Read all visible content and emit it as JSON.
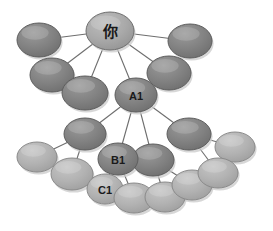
{
  "diagram": {
    "background_color": "#ffffff",
    "colors": {
      "node_dark_fill": "#7f7f7f",
      "node_dark_stroke": "#5e5e5e",
      "node_light_fill": "#b0b0b0",
      "node_light_stroke": "#8a8a8a",
      "node_root_fill": "#a8a8a8",
      "node_root_stroke": "#6f6f6f",
      "edge_color": "#6e6e6e",
      "label_color": "#1a1a1a",
      "shadow_color": "#c9c9c9"
    },
    "nodes": [
      {
        "id": "root",
        "label": "你",
        "cx": 110,
        "cy": 31,
        "rx": 24,
        "ry": 19,
        "tone": "root",
        "font_size": 15
      },
      {
        "id": "n-tl1",
        "label": "",
        "cx": 39,
        "cy": 40,
        "rx": 22,
        "ry": 17,
        "tone": "dark",
        "font_size": 9
      },
      {
        "id": "n-tl2",
        "label": "",
        "cx": 52,
        "cy": 75,
        "rx": 22,
        "ry": 17,
        "tone": "dark",
        "font_size": 9
      },
      {
        "id": "n-tl3",
        "label": "",
        "cx": 85,
        "cy": 93,
        "rx": 23,
        "ry": 17,
        "tone": "dark",
        "font_size": 9
      },
      {
        "id": "n-tr1",
        "label": "",
        "cx": 190,
        "cy": 41,
        "rx": 22,
        "ry": 17,
        "tone": "dark",
        "font_size": 9
      },
      {
        "id": "n-tr2",
        "label": "",
        "cx": 169,
        "cy": 73,
        "rx": 22,
        "ry": 17,
        "tone": "dark",
        "font_size": 9
      },
      {
        "id": "a1",
        "label": "A1",
        "cx": 136,
        "cy": 95,
        "rx": 21,
        "ry": 17,
        "tone": "dark",
        "font_size": 11
      },
      {
        "id": "n-m1",
        "label": "",
        "cx": 85,
        "cy": 134,
        "rx": 21,
        "ry": 16,
        "tone": "dark",
        "font_size": 9
      },
      {
        "id": "n-m2",
        "label": "",
        "cx": 153,
        "cy": 160,
        "rx": 21,
        "ry": 16,
        "tone": "dark",
        "font_size": 9
      },
      {
        "id": "n-m3",
        "label": "",
        "cx": 189,
        "cy": 134,
        "rx": 22,
        "ry": 16,
        "tone": "dark",
        "font_size": 9
      },
      {
        "id": "b1",
        "label": "B1",
        "cx": 118,
        "cy": 159,
        "rx": 20,
        "ry": 16,
        "tone": "dark",
        "font_size": 11
      },
      {
        "id": "n-l1",
        "label": "",
        "cx": 37,
        "cy": 157,
        "rx": 20,
        "ry": 15,
        "tone": "light",
        "font_size": 9
      },
      {
        "id": "n-l2",
        "label": "",
        "cx": 72,
        "cy": 174,
        "rx": 21,
        "ry": 16,
        "tone": "light",
        "font_size": 9
      },
      {
        "id": "c1",
        "label": "C1",
        "cx": 105,
        "cy": 189,
        "rx": 18,
        "ry": 15,
        "tone": "light",
        "font_size": 11
      },
      {
        "id": "n-b1",
        "label": "",
        "cx": 134,
        "cy": 198,
        "rx": 20,
        "ry": 15,
        "tone": "light",
        "font_size": 9
      },
      {
        "id": "n-b2",
        "label": "",
        "cx": 165,
        "cy": 197,
        "rx": 20,
        "ry": 15,
        "tone": "light",
        "font_size": 9
      },
      {
        "id": "n-b3",
        "label": "",
        "cx": 192,
        "cy": 185,
        "rx": 20,
        "ry": 15,
        "tone": "light",
        "font_size": 9
      },
      {
        "id": "n-r1",
        "label": "",
        "cx": 235,
        "cy": 147,
        "rx": 20,
        "ry": 15,
        "tone": "light",
        "font_size": 9
      },
      {
        "id": "n-r2",
        "label": "",
        "cx": 218,
        "cy": 173,
        "rx": 20,
        "ry": 15,
        "tone": "light",
        "font_size": 9
      }
    ],
    "edges": [
      {
        "from": "root",
        "to": "n-tl1"
      },
      {
        "from": "root",
        "to": "n-tl2"
      },
      {
        "from": "root",
        "to": "n-tl3"
      },
      {
        "from": "root",
        "to": "n-tr1"
      },
      {
        "from": "root",
        "to": "n-tr2"
      },
      {
        "from": "root",
        "to": "a1"
      },
      {
        "from": "a1",
        "to": "n-m1"
      },
      {
        "from": "a1",
        "to": "b1"
      },
      {
        "from": "a1",
        "to": "n-m2"
      },
      {
        "from": "a1",
        "to": "n-m3"
      },
      {
        "from": "n-m1",
        "to": "n-l1"
      },
      {
        "from": "n-m1",
        "to": "n-l2"
      },
      {
        "from": "b1",
        "to": "c1"
      },
      {
        "from": "b1",
        "to": "n-b1"
      },
      {
        "from": "n-m2",
        "to": "n-b2"
      },
      {
        "from": "n-m2",
        "to": "n-b3"
      },
      {
        "from": "n-m3",
        "to": "n-r1"
      },
      {
        "from": "n-m3",
        "to": "n-r2"
      }
    ]
  }
}
